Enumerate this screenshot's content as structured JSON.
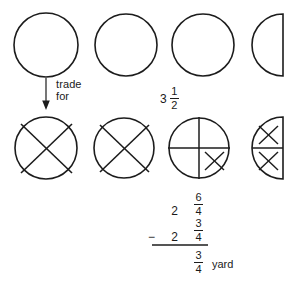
{
  "document": {
    "title": "Fraction subtraction circle model worksheet",
    "background_color": "#ffffff",
    "ink_color": "#1c1c1c"
  },
  "annotations": {
    "trade_line1": "trade",
    "trade_line2": "for",
    "arrow_direction": "down"
  },
  "top_row": {
    "description": "Three whole circles and one left-facing half circle representing 3 1/2",
    "quantity_label": {
      "whole": "3",
      "numerator": "1",
      "denominator": "2"
    },
    "shapes": [
      {
        "name": "whole-circle-1",
        "type": "circle",
        "state": "empty"
      },
      {
        "name": "whole-circle-2",
        "type": "circle",
        "state": "empty"
      },
      {
        "name": "whole-circle-3",
        "type": "circle",
        "state": "empty"
      },
      {
        "name": "half-circle-1",
        "type": "half-circle",
        "state": "empty"
      }
    ]
  },
  "bottom_row": {
    "description": "Two crossed-out whole circles, one circle split in fourths with one fourth crossed out, and a half circle split in fourths with both crossed out",
    "shapes": [
      {
        "name": "crossed-circle-1",
        "type": "circle",
        "state": "crossed-out"
      },
      {
        "name": "crossed-circle-2",
        "type": "circle",
        "state": "crossed-out"
      },
      {
        "name": "quartered-circle",
        "type": "circle-fourths",
        "state": "one-fourth-crossed-out"
      },
      {
        "name": "quartered-half-circle",
        "type": "half-circle-fourths",
        "state": "two-fourths-crossed-out"
      }
    ]
  },
  "arithmetic": {
    "minuend": {
      "whole": "2",
      "numerator": "6",
      "denominator": "4"
    },
    "operator": "−",
    "subtrahend": {
      "whole": "2",
      "numerator": "3",
      "denominator": "4"
    },
    "result": {
      "numerator": "3",
      "denominator": "4"
    },
    "result_unit": "yard"
  }
}
